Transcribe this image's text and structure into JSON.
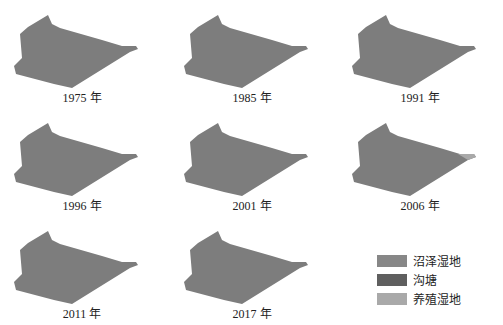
{
  "figure": {
    "panels": [
      {
        "year_label": "1975 年",
        "x": 2,
        "y": 0
      },
      {
        "year_label": "1985 年",
        "x": 172,
        "y": 0
      },
      {
        "year_label": "1991 年",
        "x": 340,
        "y": 0
      },
      {
        "year_label": "1996 年",
        "x": 2,
        "y": 108
      },
      {
        "year_label": "2001 年",
        "x": 172,
        "y": 108
      },
      {
        "year_label": "2006 年",
        "x": 340,
        "y": 108
      },
      {
        "year_label": "2011 年",
        "x": 2,
        "y": 216
      },
      {
        "year_label": "2017 年",
        "x": 172,
        "y": 216
      }
    ],
    "legend": [
      {
        "label": "沼泽湿地",
        "color": "#878787"
      },
      {
        "label": "沟塘",
        "color": "#5f5f5f"
      },
      {
        "label": "养殖湿地",
        "color": "#a9a9a9"
      }
    ],
    "shape_color": "#7d7d7d"
  }
}
